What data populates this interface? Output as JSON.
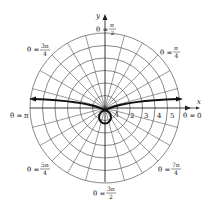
{
  "diagram": {
    "type": "polar-graph",
    "grid": {
      "circle_radii": [
        1,
        2,
        3,
        4,
        5,
        6
      ],
      "ray_step_degrees": 15
    },
    "axes": {
      "x_label": "x",
      "y_label": "y"
    },
    "radial_ticks": [
      "1",
      "2",
      "3",
      "4",
      "5"
    ],
    "angle_labels": [
      {
        "id": "theta-0",
        "prefix": "θ = ",
        "text": "0"
      },
      {
        "id": "theta-pi-over-4",
        "prefix": "θ = ",
        "num": "π",
        "den": "4"
      },
      {
        "id": "theta-pi-over-2",
        "prefix": "θ = ",
        "num": "π",
        "den": "2"
      },
      {
        "id": "theta-3pi-over-4",
        "prefix": "θ = ",
        "num": "3π",
        "den": "4"
      },
      {
        "id": "theta-pi",
        "prefix": "θ = ",
        "text": "π"
      },
      {
        "id": "theta-5pi-over-4",
        "prefix": "θ = ",
        "num": "5π",
        "den": "4"
      },
      {
        "id": "theta-3pi-over-2",
        "prefix": "θ = ",
        "num": "3π",
        "den": "2"
      },
      {
        "id": "theta-7pi-over-4",
        "prefix": "θ = ",
        "num": "7π",
        "den": "4"
      }
    ],
    "curve": {
      "description": "Curve with two arms extending left and right from the pole (arrowheads at both ends) and a small loop below the pole",
      "color": "#111111"
    }
  }
}
